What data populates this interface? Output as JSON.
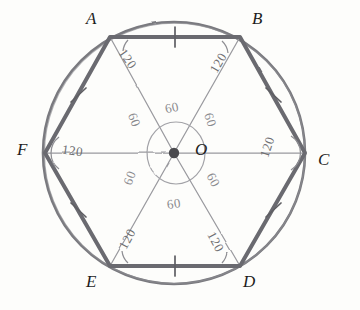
{
  "figure": {
    "shape": "regular-hexagon-inscribed-in-circle",
    "colors": {
      "hexagon_stroke": "#6b6b70",
      "circle_stroke": "#77777c",
      "radius_stroke": "#9a9a9f",
      "ink": "#6f6f72",
      "label_ink": "#1d1d1d",
      "paper": "#fdfdfb",
      "center_dot": "#4a4a4e"
    },
    "geometry": {
      "center": {
        "x": 174,
        "y": 153
      },
      "circle_radius": 131,
      "hexagon_radius": 130,
      "inner_circle_radius": 29
    }
  },
  "vertices": [
    {
      "id": "A",
      "label": "A",
      "x": 110,
      "y": 37,
      "label_x": 86,
      "label_y": 9,
      "angle_deg": 120,
      "angle_text": "120"
    },
    {
      "id": "B",
      "label": "B",
      "x": 240,
      "y": 37,
      "label_x": 252,
      "label_y": 9,
      "angle_deg": 120,
      "angle_text": "120"
    },
    {
      "id": "C",
      "label": "C",
      "x": 305,
      "y": 153,
      "label_x": 318,
      "label_y": 150,
      "angle_deg": 120,
      "angle_text": "120"
    },
    {
      "id": "D",
      "label": "D",
      "x": 240,
      "y": 266,
      "label_x": 243,
      "label_y": 272,
      "angle_deg": 120,
      "angle_text": "120"
    },
    {
      "id": "E",
      "label": "E",
      "x": 110,
      "y": 266,
      "label_x": 86,
      "label_y": 272,
      "angle_deg": 120,
      "angle_text": "120"
    },
    {
      "id": "F",
      "label": "F",
      "x": 45,
      "y": 153,
      "label_x": 17,
      "label_y": 140,
      "angle_deg": 120,
      "angle_text": "120"
    }
  ],
  "centre": {
    "id": "O",
    "label": "O",
    "label_x": 195,
    "label_y": 140,
    "dot_x": 174,
    "dot_y": 153
  },
  "interior_angle_labels": [
    {
      "text": "120",
      "x": 117,
      "y": 51,
      "rotate": 55
    },
    {
      "text": "120",
      "x": 208,
      "y": 55,
      "rotate": -60
    },
    {
      "text": "120",
      "x": 257,
      "y": 139,
      "rotate": -72
    },
    {
      "text": "120",
      "x": 205,
      "y": 234,
      "rotate": 62
    },
    {
      "text": "120",
      "x": 117,
      "y": 231,
      "rotate": -62
    },
    {
      "text": "120",
      "x": 62,
      "y": 143,
      "rotate": 8
    }
  ],
  "central_angle_labels": [
    {
      "text": "60",
      "x": 165,
      "y": 100,
      "rotate": -12
    },
    {
      "text": "60",
      "x": 203,
      "y": 112,
      "rotate": 72
    },
    {
      "text": "60",
      "x": 206,
      "y": 172,
      "rotate": 62
    },
    {
      "text": "60",
      "x": 167,
      "y": 196,
      "rotate": -8
    },
    {
      "text": "60",
      "x": 123,
      "y": 170,
      "rotate": -70
    },
    {
      "text": "60",
      "x": 127,
      "y": 112,
      "rotate": 68
    }
  ],
  "side_tick_marks": [
    {
      "side": "AB",
      "x": 175,
      "y": 37
    },
    {
      "side": "BC",
      "x": 273,
      "y": 95
    },
    {
      "side": "CD",
      "x": 273,
      "y": 210
    },
    {
      "side": "DE",
      "x": 175,
      "y": 266
    },
    {
      "side": "EF",
      "x": 78,
      "y": 210
    },
    {
      "side": "FA",
      "x": 78,
      "y": 95
    }
  ],
  "annotations": {
    "hexagon_sides": "AB, BC, CD, DE, EF, FA all marked equal with single tick",
    "radii": "OA, OB, OC, OD, OE, OF drawn from centre O",
    "central_angles_sum": 360,
    "interior_angles_sum": 720
  }
}
